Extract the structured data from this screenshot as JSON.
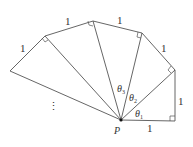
{
  "diagram": {
    "title": "",
    "point_label": "P",
    "edge_labels": [
      "1",
      "1",
      "1",
      "1",
      "1",
      "1"
    ],
    "angle_labels": [
      {
        "sym": "θ",
        "sub": "1"
      },
      {
        "sym": "θ",
        "sub": "2"
      },
      {
        "sym": "θ",
        "sub": "3"
      }
    ],
    "ellipsis": "⋮",
    "vertices": {
      "P": [
        121,
        120
      ],
      "A1": [
        175,
        121
      ],
      "A2": [
        175,
        70
      ],
      "A3": [
        142,
        33
      ],
      "A4": [
        93,
        21
      ],
      "A5": [
        45,
        36
      ],
      "A6": [
        10,
        71
      ]
    },
    "stroke_color": "#555555"
  }
}
